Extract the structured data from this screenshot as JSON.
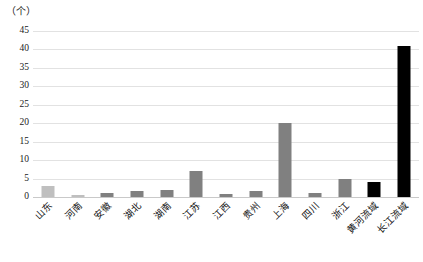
{
  "chart_data": {
    "type": "bar",
    "title": "",
    "subtitle": "",
    "unit_label": "（个）",
    "xlabel": "",
    "ylabel": "",
    "ylim": [
      0,
      45
    ],
    "yticks": [
      0,
      5,
      10,
      15,
      20,
      25,
      30,
      35,
      40,
      45
    ],
    "grid": true,
    "legend": "none",
    "categories": [
      "山东",
      "河南",
      "安徽",
      "湖北",
      "湖南",
      "江苏",
      "江西",
      "贵州",
      "上海",
      "四川",
      "浙江",
      "黄河流域",
      "长江流域"
    ],
    "values": [
      3,
      0.6,
      1,
      1.5,
      2,
      7,
      0.8,
      1.5,
      20,
      1,
      5,
      4,
      41
    ],
    "colors": [
      "#bfbfbf",
      "#bfbfbf",
      "#808080",
      "#808080",
      "#808080",
      "#808080",
      "#808080",
      "#808080",
      "#808080",
      "#808080",
      "#808080",
      "#000000",
      "#000000"
    ],
    "series": [
      {
        "name": "数量",
        "values": [
          3,
          0.6,
          1,
          1.5,
          2,
          7,
          0.8,
          1.5,
          20,
          1,
          5,
          4,
          41
        ]
      }
    ]
  },
  "colors": {
    "bar_light_gray": "#bfbfbf",
    "bar_gray": "#808080",
    "bar_black": "#000000",
    "gridline": "#e2e2e2",
    "text": "#1a1a1a"
  }
}
